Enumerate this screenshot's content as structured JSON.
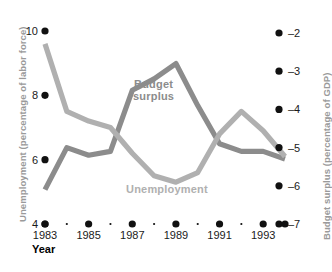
{
  "chart_data": {
    "type": "line",
    "title": "",
    "xlabel": "Year",
    "x": [
      1983,
      1984,
      1985,
      1986,
      1987,
      1988,
      1989,
      1990,
      1991,
      1992,
      1993,
      1994
    ],
    "xtick_labels": [
      "1983",
      "1985",
      "1987",
      "1989",
      "1991",
      "1993"
    ],
    "xticks": [
      1983,
      1985,
      1987,
      1989,
      1991,
      1993
    ],
    "grid": false,
    "legend_position": "inline-annotations",
    "axes": [
      {
        "id": "left",
        "label": "Unemployment (percentage of labor force)",
        "ticks": [
          "10",
          "8",
          "6",
          "4"
        ],
        "tick_values": [
          10,
          8,
          6,
          4
        ],
        "lim": [
          4,
          10
        ]
      },
      {
        "id": "right",
        "label": "Budget surplus (percentage of GDP)",
        "ticks": [
          "–2",
          "–3",
          "–4",
          "–5",
          "–6",
          "–7"
        ],
        "tick_values": [
          -2,
          -3,
          -4,
          -5,
          -6,
          -7
        ],
        "lim": [
          -7,
          -2
        ]
      }
    ],
    "series": [
      {
        "name": "Unemployment",
        "axis": "left",
        "color": "#b0b0b0",
        "unit": "percentage of labor force",
        "values": [
          9.6,
          7.5,
          7.2,
          7.0,
          6.2,
          5.5,
          5.3,
          5.6,
          6.8,
          7.5,
          6.9,
          6.1
        ]
      },
      {
        "name": "Budget surplus",
        "axis": "right",
        "color": "#8c8c8c",
        "unit": "percentage of GDP",
        "values": [
          -6.1,
          -5.0,
          -5.2,
          -5.1,
          -3.5,
          -3.2,
          -2.8,
          -3.9,
          -4.9,
          -5.1,
          -5.1,
          -5.3
        ]
      }
    ],
    "annotations": [
      {
        "text": "Budget surplus",
        "series": "Budget surplus",
        "color": "#8c8c8c"
      },
      {
        "text": "Unemployment",
        "series": "Unemployment",
        "color": "#b0b0b0"
      }
    ]
  },
  "labels": {
    "y_left_title": "Unemployment (percentage of labor force)",
    "y_right_title": "Budget surplus (percentage of GDP)",
    "x_title": "Year",
    "budget_line1": "Budget",
    "budget_line2": "surplus",
    "unemployment": "Unemployment"
  },
  "ticks": {
    "left": [
      "10",
      "8",
      "6",
      "4"
    ],
    "right": [
      "–2",
      "–3",
      "–4",
      "–5",
      "–6",
      "–7"
    ],
    "x": [
      "1983",
      "1985",
      "1987",
      "1989",
      "1991",
      "1993"
    ]
  },
  "colors": {
    "unemployment_line": "#b0b0b0",
    "budget_line": "#8c8c8c",
    "tick_dot": "#111111",
    "axis_title": "#9a9a9a",
    "background": "#ffffff"
  }
}
